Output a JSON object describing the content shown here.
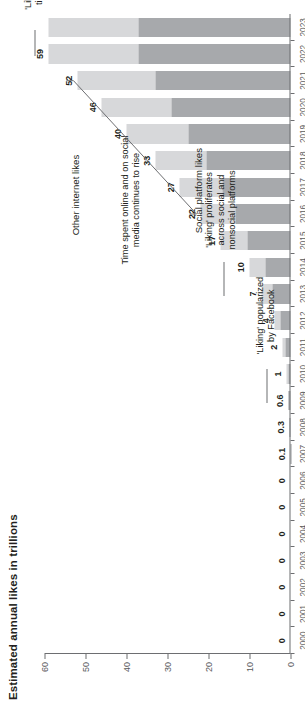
{
  "chart": {
    "title": "Estimated annual likes in trillions",
    "ylabel": "",
    "xlabel": ""
  },
  "legend": {
    "other_label": "Other internet likes",
    "social_label": "Social platform likes"
  },
  "annotations": {
    "a1": "'Liking' mostly on nonsocial\nplatforms (e.g., e-commerce)",
    "a1_line1": "'Liking' mostly on nonsocial",
    "a1_line2": "platforms (e.g., e-commerce)",
    "a2_line1": "'Liking' popularized",
    "a2_line2": "by Facebook",
    "a3_line1": "'Liking' proliferates",
    "a3_line2": "across social and",
    "a3_line3": "nonsocial platforms",
    "a4_line1": "Time spent online and on social",
    "a4_line2": "media continues to rise",
    "a5_line1": "'Like' pressed 300+ trillion",
    "a5_line2": "times since introduction"
  },
  "colors": {
    "social": "#a7a9ac",
    "other": "#d7d8da",
    "axis": "#6d6e71",
    "text": "#231f20",
    "background": "#ffffff"
  },
  "chart_data": {
    "type": "bar",
    "subtype": "stacked-bar-horizontal-rotated",
    "title": "Estimated annual likes in trillions",
    "xlabel": "",
    "ylabel": "Estimated annual likes in trillions",
    "ylim": [
      0,
      60
    ],
    "yticks": [
      0,
      10,
      20,
      30,
      40,
      50,
      60
    ],
    "ytick_labels": [
      "0",
      "10",
      "20",
      "30",
      "40",
      "50",
      "60"
    ],
    "grid": false,
    "legend_position": "top-right-rotated",
    "categories": [
      "2000",
      "2001",
      "2002",
      "2003",
      "2004",
      "2005",
      "2006",
      "2007",
      "2008",
      "2009",
      "2010",
      "2011",
      "2012",
      "2013",
      "2014",
      "2015",
      "2016",
      "2017",
      "2018",
      "2019",
      "2020",
      "2021",
      "2022",
      "2023"
    ],
    "totals": [
      0,
      0,
      0,
      0,
      0,
      0,
      0,
      0.1,
      0.3,
      0.6,
      1,
      2,
      4,
      7,
      10,
      17,
      22,
      27,
      33,
      40,
      46,
      52,
      59,
      59
    ],
    "data_labels": [
      "0",
      "0",
      "0",
      "0",
      "0",
      "0",
      "0",
      "0.1",
      "0.3",
      "0.6",
      "1",
      "2",
      "4",
      "7",
      "10",
      "17",
      "22",
      "27",
      "33",
      "40",
      "46",
      "52",
      "59",
      ""
    ],
    "series": [
      {
        "name": "Social platform likes",
        "color": "#a7a9ac",
        "values": [
          0,
          0,
          0,
          0,
          0,
          0,
          0,
          0.05,
          0.18,
          0.38,
          0.6,
          1.2,
          2.4,
          4.3,
          6.2,
          10.5,
          13.5,
          16.5,
          20.5,
          25,
          29,
          33,
          37,
          37
        ]
      },
      {
        "name": "Other internet likes",
        "color": "#d7d8da",
        "values": [
          0,
          0,
          0,
          0,
          0,
          0,
          0,
          0.05,
          0.12,
          0.22,
          0.4,
          0.8,
          1.6,
          2.7,
          3.8,
          6.5,
          8.5,
          10.5,
          12.5,
          15,
          17,
          19,
          22,
          22
        ]
      }
    ],
    "annotations": [
      {
        "text": "'Liking' mostly on nonsocial platforms (e.g., e-commerce)",
        "span": [
          "2000",
          "2008"
        ]
      },
      {
        "text": "'Liking' popularized by Facebook",
        "points_to": "2009"
      },
      {
        "text": "'Liking' proliferates across social and nonsocial platforms",
        "points_to": "2013"
      },
      {
        "text": "Time spent online and on social media continues to rise",
        "span": [
          "2017",
          "2022"
        ]
      },
      {
        "text": "'Like' pressed 300+ trillion times since introduction",
        "points_to": "2023"
      }
    ]
  }
}
